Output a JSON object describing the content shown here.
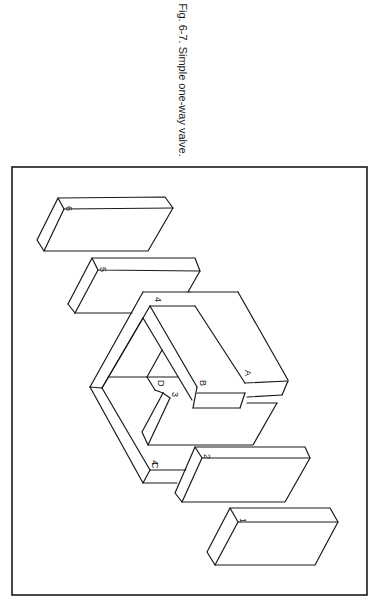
{
  "caption": "Fig. 6-7. Simple one-way valve.",
  "diagram": {
    "type": "exploded isometric view",
    "part_labels": {
      "p1": "1",
      "p2": "2",
      "p3": "3",
      "p4": "4",
      "p5": "5",
      "p6": "6",
      "A": "A",
      "B": "B",
      "C": "C",
      "D": "D"
    },
    "colors": {
      "line": "#1a1a1a",
      "background": "#ffffff"
    }
  }
}
